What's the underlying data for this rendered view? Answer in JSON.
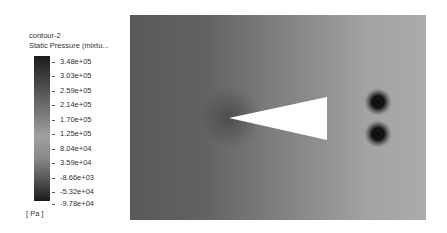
{
  "legend": {
    "title_line1": "contour-2",
    "title_line2": "Static Pressure (mixtu...",
    "unit": "[ Pa ]",
    "ticks": [
      "3.48e+05",
      "3.03e+05",
      "2.59e+05",
      "2.14e+05",
      "1.70e+05",
      "1.25e+05",
      "8.04e+04",
      "3.59e+04",
      "-8.66e+03",
      "-5.32e+04",
      "-9.78e+04"
    ]
  },
  "plot": {
    "type": "contour",
    "quantity": "Static Pressure",
    "colormap": "grayscale",
    "range": [
      -97800,
      348000
    ],
    "features": [
      {
        "name": "wedge",
        "shape": "triangle",
        "fill": "#ffffff"
      },
      {
        "name": "low-pressure-spot-upper",
        "shape": "circle",
        "fill": "#111111"
      },
      {
        "name": "low-pressure-spot-lower",
        "shape": "circle",
        "fill": "#111111"
      }
    ]
  }
}
